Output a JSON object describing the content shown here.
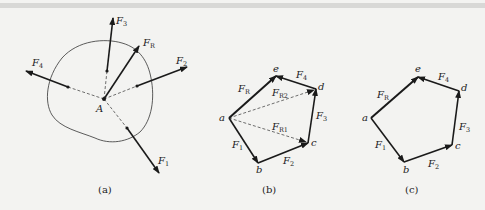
{
  "figure": {
    "panels": [
      {
        "id": "a",
        "caption": "(a)",
        "point_label": "A",
        "forces": [
          {
            "name": "F",
            "sub": "1"
          },
          {
            "name": "F",
            "sub": "2"
          },
          {
            "name": "F",
            "sub": "3"
          },
          {
            "name": "F",
            "sub": "4"
          },
          {
            "name": "F",
            "sub": "R"
          }
        ]
      },
      {
        "id": "b",
        "caption": "(b)",
        "vertices": [
          "a",
          "b",
          "c",
          "d",
          "e"
        ],
        "forces": [
          {
            "name": "F",
            "sub": "1"
          },
          {
            "name": "F",
            "sub": "2"
          },
          {
            "name": "F",
            "sub": "3"
          },
          {
            "name": "F",
            "sub": "4"
          },
          {
            "name": "F",
            "sub": "R"
          },
          {
            "name": "F",
            "sub": "R1"
          },
          {
            "name": "F",
            "sub": "R2"
          }
        ]
      },
      {
        "id": "c",
        "caption": "(c)",
        "vertices": [
          "a",
          "b",
          "c",
          "d",
          "e"
        ],
        "forces": [
          {
            "name": "F",
            "sub": "1"
          },
          {
            "name": "F",
            "sub": "2"
          },
          {
            "name": "F",
            "sub": "3"
          },
          {
            "name": "F",
            "sub": "4"
          },
          {
            "name": "F",
            "sub": "R"
          }
        ]
      }
    ],
    "colors": {
      "ink": "#1a1a1a",
      "background": "#f3f3f1"
    }
  }
}
